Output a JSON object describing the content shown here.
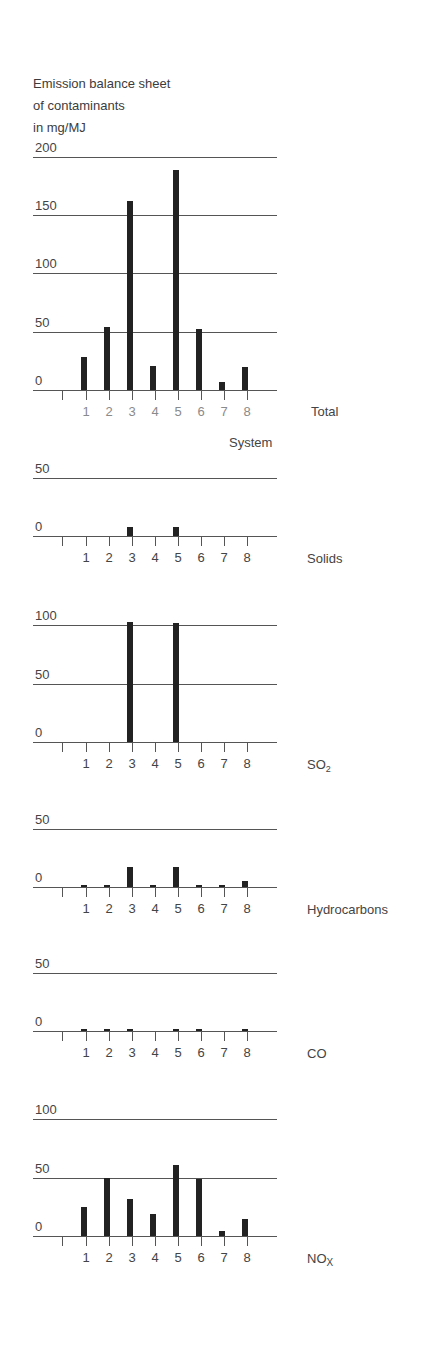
{
  "title": {
    "lines": [
      "Emission balance sheet",
      "of contaminants",
      "in mg/MJ"
    ]
  },
  "x_axis_title": "System",
  "colors": {
    "bar": "#222222",
    "gridline": "#555555",
    "total_tick_label": "#8a8a8a",
    "tick_label": "#444444"
  },
  "chart_data": [
    {
      "type": "bar",
      "title": "Total",
      "subtitle": "Emission balance sheet of contaminants in mg/MJ",
      "xlabel": "System",
      "ylabel": "mg/MJ",
      "categories": [
        "1",
        "2",
        "3",
        "4",
        "5",
        "6",
        "7",
        "8"
      ],
      "values": [
        28,
        54,
        162,
        21,
        189,
        52,
        7,
        20
      ],
      "yticks": [
        0,
        50,
        100,
        150,
        200
      ],
      "ylim": [
        0,
        200
      ],
      "grid": true,
      "legend": "none"
    },
    {
      "type": "bar",
      "title": "Solids",
      "xlabel": "System",
      "categories": [
        "1",
        "2",
        "3",
        "4",
        "5",
        "6",
        "7",
        "8"
      ],
      "values": [
        0,
        0,
        8,
        0,
        8,
        0,
        0,
        0
      ],
      "yticks": [
        0,
        50
      ],
      "ylim": [
        0,
        50
      ],
      "grid": true
    },
    {
      "type": "bar",
      "title": "SO2",
      "xlabel": "System",
      "categories": [
        "1",
        "2",
        "3",
        "4",
        "5",
        "6",
        "7",
        "8"
      ],
      "values": [
        0,
        0,
        103,
        0,
        102,
        0,
        0,
        0
      ],
      "yticks": [
        0,
        50,
        100
      ],
      "ylim": [
        0,
        100
      ],
      "grid": true
    },
    {
      "type": "bar",
      "title": "Hydrocarbons",
      "xlabel": "System",
      "categories": [
        "1",
        "2",
        "3",
        "4",
        "5",
        "6",
        "7",
        "8"
      ],
      "values": [
        2,
        2,
        17,
        1,
        17,
        1,
        2,
        5
      ],
      "yticks": [
        0,
        50
      ],
      "ylim": [
        0,
        50
      ],
      "grid": true
    },
    {
      "type": "bar",
      "title": "CO",
      "xlabel": "System",
      "categories": [
        "1",
        "2",
        "3",
        "4",
        "5",
        "6",
        "7",
        "8"
      ],
      "values": [
        1,
        1,
        1.5,
        0,
        1,
        1,
        0,
        1
      ],
      "yticks": [
        0,
        50
      ],
      "ylim": [
        0,
        50
      ],
      "grid": true
    },
    {
      "type": "bar",
      "title": "NOx",
      "xlabel": "System",
      "categories": [
        "1",
        "2",
        "3",
        "4",
        "5",
        "6",
        "7",
        "8"
      ],
      "values": [
        25,
        50,
        32,
        19,
        61,
        49,
        4,
        15
      ],
      "yticks": [
        0,
        50,
        100
      ],
      "ylim": [
        0,
        100
      ],
      "grid": true
    }
  ],
  "panels": [
    {
      "name": "Total",
      "label_main": "Total",
      "label_sub": "",
      "tick_label_color": "#8a8a8a"
    },
    {
      "name": "Solids",
      "label_main": "Solids",
      "label_sub": "",
      "tick_label_color": "#444444"
    },
    {
      "name": "SO2",
      "label_main": "SO",
      "label_sub": "2",
      "tick_label_color": "#444444"
    },
    {
      "name": "Hydrocarbons",
      "label_main": "Hydrocarbons",
      "label_sub": "",
      "tick_label_color": "#444444"
    },
    {
      "name": "CO",
      "label_main": "CO",
      "label_sub": "",
      "tick_label_color": "#444444"
    },
    {
      "name": "NOx",
      "label_main": "NO",
      "label_sub": "X",
      "tick_label_color": "#444444"
    }
  ]
}
